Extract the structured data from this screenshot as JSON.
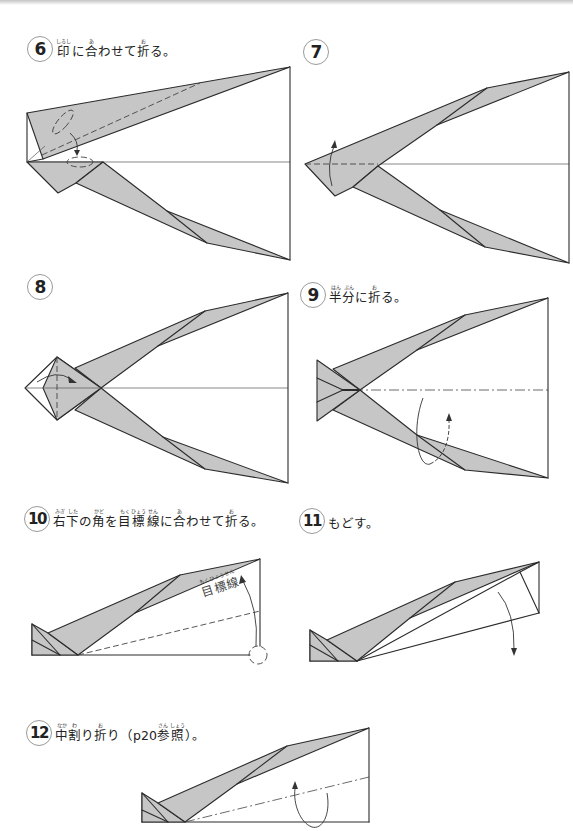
{
  "colors": {
    "background": "#ffffff",
    "line": "#2b2b2b",
    "shade": "#c6c6c6",
    "circle_border": "#9a9a9a",
    "text": "#222222"
  },
  "steps": [
    {
      "number": "6",
      "title": [
        {
          "base": "印",
          "ruby": "しるし"
        },
        {
          "base": "に"
        },
        {
          "base": "合",
          "ruby": "あ"
        },
        {
          "base": "わせて"
        },
        {
          "base": "折",
          "ruby": "お"
        },
        {
          "base": "る。"
        }
      ]
    },
    {
      "number": "7",
      "title": []
    },
    {
      "number": "8",
      "title": []
    },
    {
      "number": "9",
      "title": [
        {
          "base": "半",
          "ruby": "はん"
        },
        {
          "base": "分",
          "ruby": "ぶん"
        },
        {
          "base": "に"
        },
        {
          "base": "折",
          "ruby": "お"
        },
        {
          "base": "る。"
        }
      ]
    },
    {
      "number": "10",
      "title": [
        {
          "base": "右",
          "ruby": "みぎ"
        },
        {
          "base": "下",
          "ruby": "した"
        },
        {
          "base": "の"
        },
        {
          "base": "角",
          "ruby": "かど"
        },
        {
          "base": "を"
        },
        {
          "base": "目",
          "ruby": "もく"
        },
        {
          "base": "標",
          "ruby": "ひょう"
        },
        {
          "base": "線",
          "ruby": "せん"
        },
        {
          "base": "に"
        },
        {
          "base": "合",
          "ruby": "あ"
        },
        {
          "base": "わせて"
        },
        {
          "base": "折",
          "ruby": "お"
        },
        {
          "base": "る。"
        }
      ],
      "diagram_label": [
        {
          "base": "目",
          "ruby": "もく"
        },
        {
          "base": "標",
          "ruby": "ひょう"
        },
        {
          "base": "線",
          "ruby": "せん"
        }
      ]
    },
    {
      "number": "11",
      "title": [
        {
          "base": "もどす。"
        }
      ]
    },
    {
      "number": "12",
      "title": [
        {
          "base": "中",
          "ruby": "なか"
        },
        {
          "base": "割",
          "ruby": "わ"
        },
        {
          "base": "り"
        },
        {
          "base": "折",
          "ruby": "お"
        },
        {
          "base": "り（p20"
        },
        {
          "base": "参",
          "ruby": "さん"
        },
        {
          "base": "照",
          "ruby": "しょう"
        },
        {
          "base": "）。"
        }
      ]
    }
  ]
}
